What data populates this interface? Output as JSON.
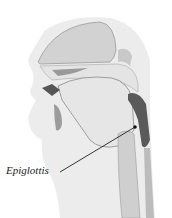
{
  "figure": {
    "labels": [
      {
        "text": "Epiglottis",
        "x": 6,
        "y": 170
      }
    ],
    "colors": {
      "skin": "#ececec",
      "tissue": "#d6d6d6",
      "dark_tissue": "#5a5a5a",
      "cavity": "#bdbdbd",
      "line": "#222222"
    }
  }
}
